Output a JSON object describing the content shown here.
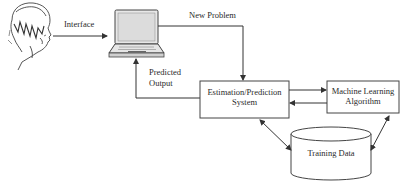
{
  "diagram": {
    "nodes": {
      "user": {
        "label": "",
        "icon": "user-head-icon"
      },
      "computer": {
        "label": "",
        "icon": "laptop-icon"
      },
      "estimation": {
        "line1": "Estimation/Prediction",
        "line2": "System"
      },
      "ml": {
        "line1": "Machine Learning",
        "line2": "Algorithm"
      },
      "training": {
        "label": "Training Data",
        "icon": "database-cylinder"
      }
    },
    "edges": {
      "interface": "Interface",
      "new_problem": "New Problem",
      "predicted_line1": "Predicted",
      "predicted_line2": "Output"
    },
    "colors": {
      "stroke": "#333333",
      "background": "#ffffff"
    }
  }
}
